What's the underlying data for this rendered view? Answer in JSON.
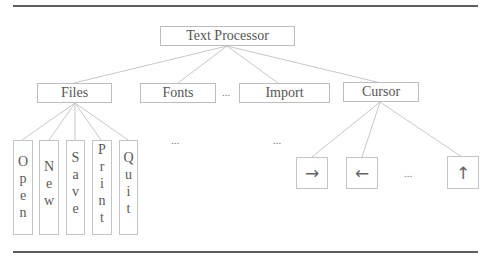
{
  "root": {
    "label": "Text Processor"
  },
  "level1": [
    {
      "id": "files",
      "label": "Files"
    },
    {
      "id": "fonts",
      "label": "Fonts"
    },
    {
      "id": "import",
      "label": "Import"
    },
    {
      "id": "cursor",
      "label": "Cursor"
    }
  ],
  "level1_ellipsis": "...",
  "files_children": [
    {
      "label": "Open",
      "letters": [
        "O",
        "p",
        "e",
        "n"
      ]
    },
    {
      "label": "New",
      "letters": [
        "N",
        "e",
        "w"
      ]
    },
    {
      "label": "Save",
      "letters": [
        "S",
        "a",
        "v",
        "e"
      ]
    },
    {
      "label": "Print",
      "letters": [
        "P",
        "r",
        "i",
        "n",
        "t"
      ]
    },
    {
      "label": "Quit",
      "letters": [
        "Q",
        "u",
        "i",
        "t"
      ]
    }
  ],
  "fonts_children_ellipsis": "...",
  "import_children_ellipsis": "...",
  "cursor_children": [
    {
      "label": "→",
      "icon": "arrow-right-icon"
    },
    {
      "label": "←",
      "icon": "arrow-left-icon"
    },
    {
      "label": "↑",
      "icon": "arrow-up-icon"
    }
  ],
  "cursor_children_ellipsis": "...",
  "colors": {
    "rule": "#5e5e5e",
    "edge": "#c8c8c8",
    "border": "#bdbdbd",
    "text": "#555555"
  }
}
